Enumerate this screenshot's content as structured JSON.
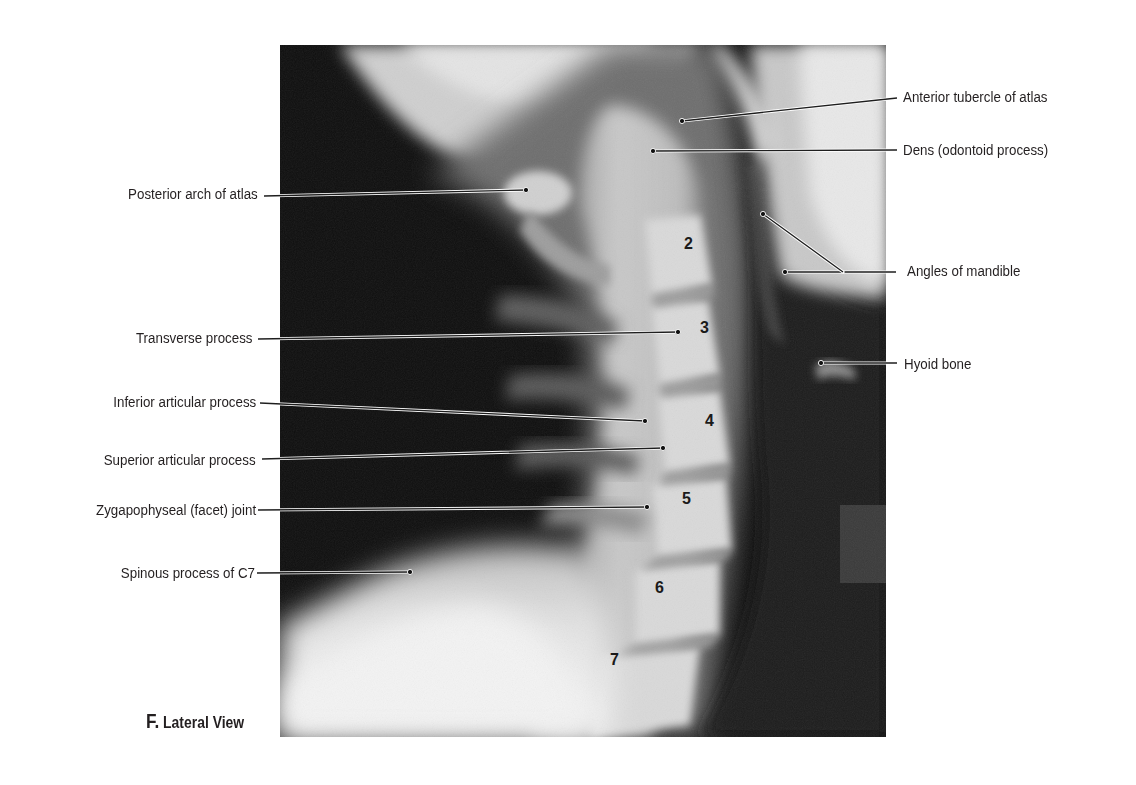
{
  "figure": {
    "caption_letter": "F.",
    "caption_text": "Lateral View",
    "image_box": {
      "x": 280,
      "y": 45,
      "w": 606,
      "h": 692
    }
  },
  "labels_left": [
    {
      "text": "Posterior arch of atlas",
      "text_right": 258,
      "y": 194,
      "line_from": [
        264,
        196
      ],
      "line_to": [
        526,
        190
      ]
    },
    {
      "text": "Transverse process",
      "text_right": 253,
      "y": 338,
      "line_from": [
        258,
        339
      ],
      "line_to": [
        678,
        332
      ]
    },
    {
      "text": "Inferior articular process",
      "text_right": 256,
      "y": 402,
      "line_from": [
        260,
        403
      ],
      "line_to": [
        645,
        421
      ]
    },
    {
      "text": "Superior articular process",
      "text_right": 256,
      "y": 460,
      "line_from": [
        262,
        459
      ],
      "line_to": [
        663,
        448
      ]
    },
    {
      "text": "Zygapophyseal (facet) joint",
      "text_right": 256,
      "y": 510,
      "line_from": [
        258,
        510
      ],
      "line_to": [
        647,
        507
      ]
    },
    {
      "text": "Spinous process of C7",
      "text_right": 255,
      "y": 573,
      "line_from": [
        257,
        573
      ],
      "line_to": [
        410,
        572
      ]
    }
  ],
  "labels_right": [
    {
      "text": "Anterior tubercle of atlas",
      "text_left": 903,
      "y": 97,
      "line_from": [
        897,
        98
      ],
      "line_to": [
        682,
        121
      ]
    },
    {
      "text": "Dens (odontoid process)",
      "text_left": 903,
      "y": 150,
      "line_from": [
        897,
        150
      ],
      "line_to": [
        653,
        151
      ]
    },
    {
      "text": "Angles of mandible",
      "text_left": 907,
      "y": 271,
      "line_from": [
        896,
        272
      ],
      "line_to": [
        785,
        272
      ],
      "extra_line": {
        "from": [
          843,
          272
        ],
        "to": [
          763,
          214
        ]
      }
    },
    {
      "text": "Hyoid bone",
      "text_left": 904,
      "y": 364,
      "line_from": [
        897,
        363
      ],
      "line_to": [
        821,
        363
      ]
    }
  ],
  "vertebra_numbers": [
    {
      "text": "2",
      "x": 689,
      "y": 244
    },
    {
      "text": "3",
      "x": 705,
      "y": 328
    },
    {
      "text": "4",
      "x": 710,
      "y": 421
    },
    {
      "text": "5",
      "x": 687,
      "y": 499
    },
    {
      "text": "6",
      "x": 660,
      "y": 588
    },
    {
      "text": "7",
      "x": 615,
      "y": 660
    }
  ],
  "colors": {
    "label_text": "#231f20",
    "leader_line": "#1e1e1e",
    "xray_dark": "#0d0d0d",
    "xray_bone": "#e6e6e6"
  }
}
